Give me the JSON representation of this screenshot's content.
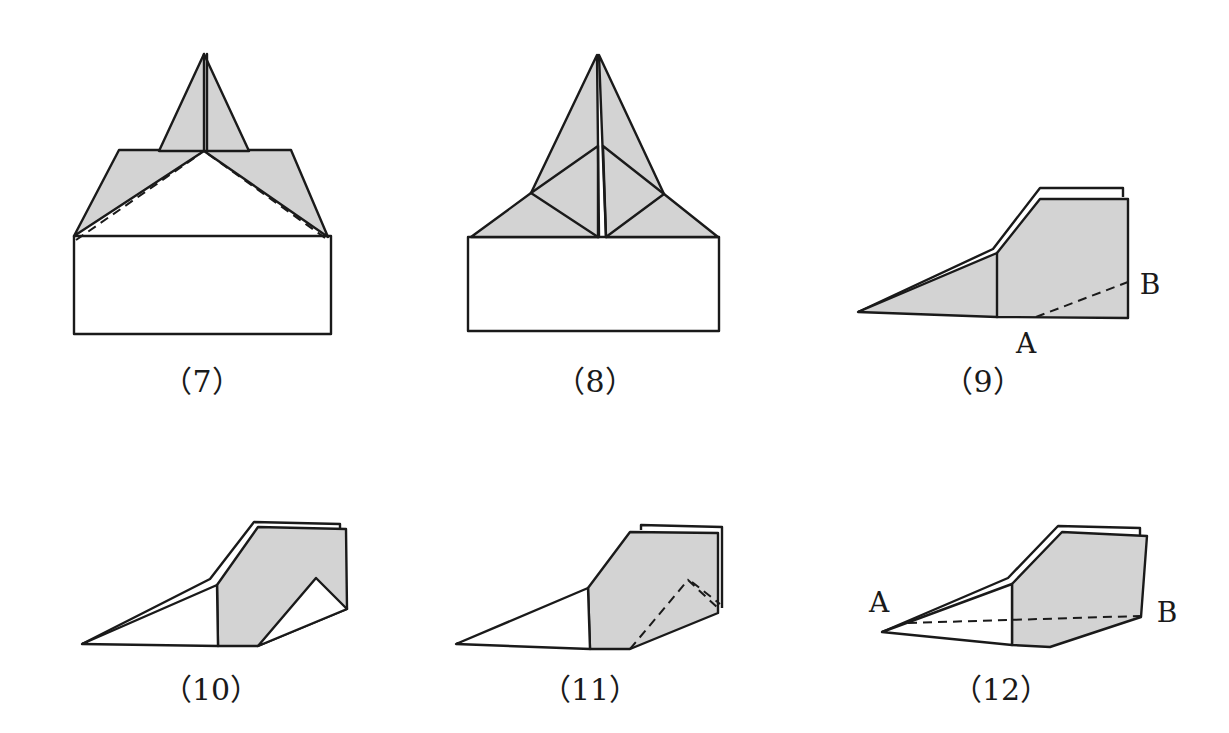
{
  "colors": {
    "paper_shaded": "#d3d3d3",
    "paper_white": "#ffffff",
    "line": "#1a1a1a"
  },
  "steps": [
    {
      "id": "7",
      "caption": "（7）"
    },
    {
      "id": "8",
      "caption": "（8）"
    },
    {
      "id": "9",
      "caption": "（9）",
      "points": {
        "a": "A",
        "b": "B"
      }
    },
    {
      "id": "10",
      "caption": "（10）"
    },
    {
      "id": "11",
      "caption": "（11）"
    },
    {
      "id": "12",
      "caption": "（12）",
      "points": {
        "a": "A",
        "b": "B"
      }
    }
  ]
}
